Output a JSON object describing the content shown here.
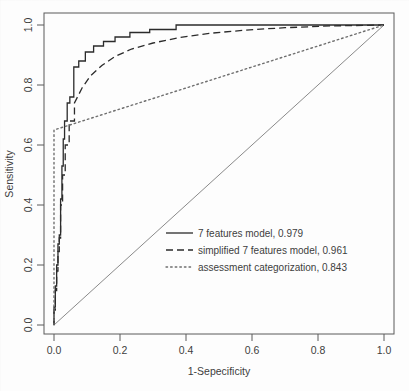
{
  "chart_data": {
    "type": "line",
    "title": "",
    "xlabel": "1-Sepecificity",
    "ylabel": "Sensitivity",
    "xlim": [
      0.0,
      1.0
    ],
    "ylim": [
      0.0,
      1.0
    ],
    "xticks": [
      "0.0",
      "0.2",
      "0.4",
      "0.6",
      "0.8",
      "1.0"
    ],
    "yticks": [
      "0.0",
      "0.2",
      "0.4",
      "0.6",
      "0.8",
      "1.0"
    ],
    "xtick_values": [
      0.0,
      0.2,
      0.4,
      0.6,
      0.8,
      1.0
    ],
    "ytick_values": [
      0.0,
      0.2,
      0.4,
      0.6,
      0.8,
      1.0
    ],
    "grid": false,
    "legend_position": "center",
    "reference_line": {
      "name": "chance diagonal",
      "style": "solid",
      "color": "#8a8a8a",
      "x": [
        0.0,
        1.0
      ],
      "y": [
        0.0,
        1.0
      ]
    },
    "series": [
      {
        "name": "7 features model",
        "auc": "0.979",
        "style": "solid",
        "color": "#2b2b2b",
        "x": [
          0.0,
          0.0,
          0.004,
          0.004,
          0.008,
          0.008,
          0.012,
          0.012,
          0.016,
          0.016,
          0.02,
          0.02,
          0.024,
          0.024,
          0.028,
          0.028,
          0.032,
          0.032,
          0.04,
          0.04,
          0.048,
          0.048,
          0.06,
          0.06,
          0.075,
          0.075,
          0.095,
          0.095,
          0.12,
          0.12,
          0.15,
          0.15,
          0.185,
          0.185,
          0.23,
          0.23,
          0.29,
          0.29,
          0.37,
          0.37,
          0.47,
          0.47,
          0.6,
          0.6,
          0.76,
          0.76,
          1.0
        ],
        "y": [
          0.0,
          0.06,
          0.06,
          0.13,
          0.13,
          0.2,
          0.2,
          0.27,
          0.27,
          0.3,
          0.3,
          0.42,
          0.42,
          0.53,
          0.53,
          0.62,
          0.62,
          0.68,
          0.68,
          0.74,
          0.74,
          0.76,
          0.76,
          0.86,
          0.86,
          0.88,
          0.88,
          0.91,
          0.91,
          0.93,
          0.93,
          0.945,
          0.945,
          0.96,
          0.96,
          0.975,
          0.975,
          0.985,
          0.985,
          1.0,
          1.0,
          1.0,
          1.0,
          1.0,
          1.0,
          1.0,
          1.0
        ]
      },
      {
        "name": "simplified 7 features model",
        "auc": "0.961",
        "style": "dashed",
        "color": "#2b2b2b",
        "x": [
          0.0,
          0.0,
          0.004,
          0.004,
          0.008,
          0.008,
          0.012,
          0.012,
          0.016,
          0.016,
          0.02,
          0.02,
          0.026,
          0.026,
          0.034,
          0.034,
          0.046,
          0.046,
          0.062,
          0.062,
          0.085,
          0.11,
          0.145,
          0.185,
          0.235,
          0.3,
          0.38,
          0.47,
          0.58,
          0.7,
          0.84,
          1.0
        ],
        "y": [
          0.0,
          0.05,
          0.05,
          0.115,
          0.115,
          0.18,
          0.18,
          0.245,
          0.245,
          0.29,
          0.29,
          0.4,
          0.4,
          0.5,
          0.5,
          0.6,
          0.6,
          0.68,
          0.68,
          0.74,
          0.79,
          0.83,
          0.865,
          0.895,
          0.92,
          0.94,
          0.958,
          0.972,
          0.983,
          0.991,
          0.997,
          1.0
        ]
      },
      {
        "name": "assessment categorization",
        "auc": "0.843",
        "style": "dotted",
        "color": "#6e6e6e",
        "x": [
          0.0,
          0.0,
          1.0
        ],
        "y": [
          0.0,
          0.65,
          1.0
        ]
      }
    ],
    "legend_entries": [
      {
        "label": "7 features model,",
        "value": "0.979",
        "style": "solid",
        "color": "#2b2b2b"
      },
      {
        "label": "simplified 7 features model,",
        "value": "0.961",
        "style": "dashed",
        "color": "#2b2b2b"
      },
      {
        "label": "assessment categorization,",
        "value": "0.843",
        "style": "dotted",
        "color": "#6e6e6e"
      }
    ]
  },
  "axes": {
    "x_title": "1-Sepecificity",
    "y_title": "Sensitivity"
  }
}
